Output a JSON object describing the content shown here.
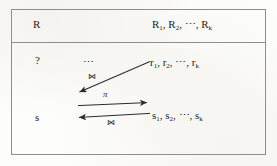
{
  "figure": {
    "background_color": "#fdfdfc",
    "line_color": "#8e8e8e",
    "text_color": "#232323"
  },
  "table": {
    "header_row": {
      "left_label": "R",
      "right_label_parts": {
        "item1_base": "R",
        "item1_sub": "1",
        "sep1": ", ",
        "item2_base": "R",
        "item2_sub": "2",
        "sep2": ", ",
        "ellipsis": "⋯",
        "sep3": ", ",
        "item3_base": "R",
        "item3_sub": "k"
      }
    },
    "body_row": {
      "left_top_label": "?",
      "left_bottom_label": "s",
      "middle_ellipsis": "⋯",
      "tuple_r_parts": {
        "item1_base": "r",
        "item1_sub": "1",
        "sep1": ", ",
        "item2_base": "r",
        "item2_sub": "2",
        "sep2": ", ",
        "ellipsis": "⋯",
        "sep3": ", ",
        "item3_base": "r",
        "item3_sub": "k"
      },
      "tuple_s_parts": {
        "item1_base": "s",
        "item1_sub": "1",
        "sep1": ", ",
        "item2_base": "s",
        "item2_sub": "2",
        "sep2": ", ",
        "ellipsis": "⋯",
        "sep3": ", ",
        "item3_base": "s",
        "item3_sub": "k"
      }
    }
  },
  "operators": {
    "join_upper": "⋈",
    "projection": "π",
    "join_lower": "⋈"
  },
  "arrows": {
    "diagonal_join": {
      "direction": "down-left",
      "from": [
        150,
        62
      ],
      "to": [
        77,
        93
      ],
      "label": "⋈"
    },
    "horizontal_right": {
      "direction": "right",
      "from": [
        78,
        106
      ],
      "to": [
        150,
        103
      ],
      "label": "π"
    },
    "horizontal_left": {
      "direction": "left",
      "from": [
        150,
        114
      ],
      "to": [
        76,
        118
      ],
      "label": "⋈"
    }
  }
}
